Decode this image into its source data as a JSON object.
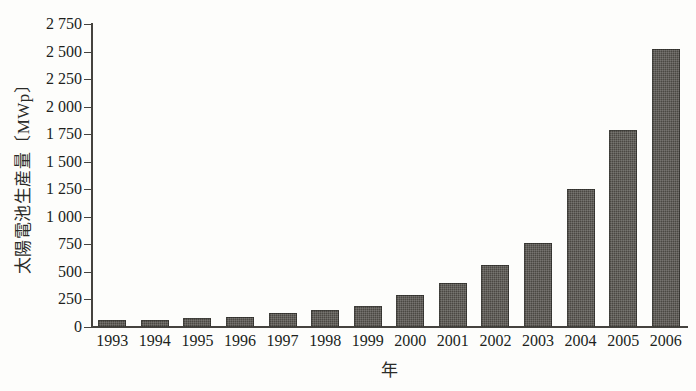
{
  "chart_data": {
    "type": "bar",
    "title": "",
    "subtitle": "",
    "xlabel": "年",
    "ylabel": "太陽電池生産量〔MWp〕",
    "categories": [
      "1993",
      "1994",
      "1995",
      "1996",
      "1997",
      "1998",
      "1999",
      "2000",
      "2001",
      "2002",
      "2003",
      "2004",
      "2005",
      "2006"
    ],
    "values": [
      60,
      65,
      78,
      89,
      126,
      155,
      190,
      288,
      400,
      560,
      760,
      1250,
      1790,
      2520
    ],
    "series": [
      {
        "name": "太陽電池生産量",
        "values": [
          60,
          65,
          78,
          89,
          126,
          155,
          190,
          288,
          400,
          560,
          760,
          1250,
          1790,
          2520
        ]
      }
    ],
    "ylim": [
      0,
      2750
    ],
    "xlim": [
      0,
      14
    ],
    "y_ticks": [
      0,
      250,
      500,
      750,
      1000,
      1250,
      1500,
      1750,
      2000,
      2250,
      2500,
      2750
    ],
    "y_tick_labels": [
      "0",
      "250",
      "500",
      "750",
      "1 000",
      "1 250",
      "1 500",
      "1 750",
      "2 000",
      "2 250",
      "2 500",
      "2 750"
    ],
    "grid": false,
    "legend": false,
    "legend_position": "none",
    "units": "MWp",
    "bar_color": "#4b4843",
    "axis_color": "#45433f",
    "background_color": "#fdfdfb",
    "annotations": []
  }
}
